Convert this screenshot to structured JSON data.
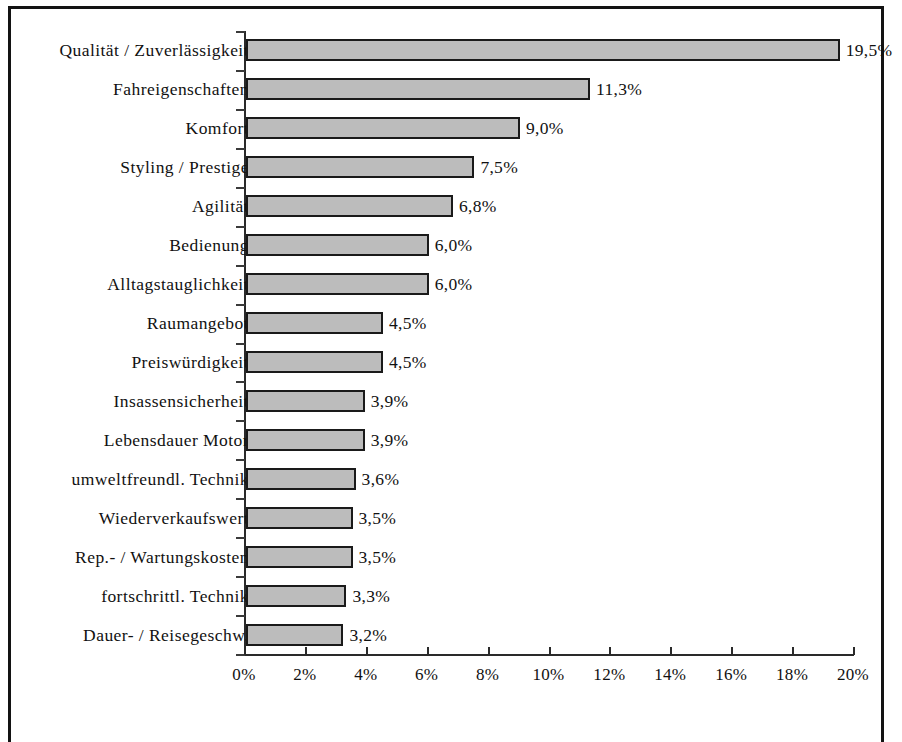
{
  "chart_data": {
    "type": "bar",
    "orientation": "horizontal",
    "title": "",
    "subtitle": "",
    "xlabel": "",
    "ylabel": "",
    "xlim": [
      0,
      20
    ],
    "xtick_step": 2,
    "grid": false,
    "legend": null,
    "value_suffix": "%",
    "decimal_separator": ",",
    "categories": [
      "Qualität / Zuverlässigkeit",
      "Fahreigenschaften",
      "Komfort",
      "Styling / Prestige",
      "Agilität",
      "Bedienung",
      "Alltagstauglichkeit",
      "Raumangebot",
      "Preiswürdigkeit",
      "Insassensicherheit",
      "Lebensdauer Motor",
      "umweltfreundl. Technik",
      "Wiederverkaufswert",
      "Rep.- / Wartungskosten",
      "fortschrittl. Technik",
      "Dauer- / Reisegeschw."
    ],
    "values": [
      19.5,
      11.3,
      9.0,
      7.5,
      6.8,
      6.0,
      6.0,
      4.5,
      4.5,
      3.9,
      3.9,
      3.6,
      3.5,
      3.5,
      3.3,
      3.2
    ],
    "value_labels": [
      "19,5%",
      "11,3%",
      "9,0%",
      "7,5%",
      "6,8%",
      "6,0%",
      "6,0%",
      "4,5%",
      "4,5%",
      "3,9%",
      "3,9%",
      "3,6%",
      "3,5%",
      "3,5%",
      "3,3%",
      "3,2%"
    ],
    "xtick_labels": [
      "0%",
      "2%",
      "4%",
      "6%",
      "8%",
      "10%",
      "12%",
      "14%",
      "16%",
      "18%",
      "20%"
    ],
    "xtick_values": [
      0,
      2,
      4,
      6,
      8,
      10,
      12,
      14,
      16,
      18,
      20
    ],
    "colors": {
      "bar_fill": "#bcbcbc",
      "bar_border": "#1a1a1a",
      "axis": "#2a2a2a",
      "text": "#111111",
      "background": "#ffffff",
      "frame_border": "#131313"
    }
  }
}
